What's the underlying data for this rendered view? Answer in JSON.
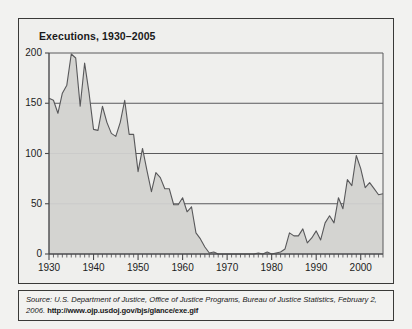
{
  "figure": {
    "title_display": "Executions, 1930–2005",
    "source_label": "Source:",
    "source_body": " U.S. Department of Justice, Office of Justice Programs, Bureau of Justice Statistics, February 2, 2006. ",
    "source_url": "http://www.ojp.usdoj.gov/bjs/glance/exe.gif",
    "panel_bg": "#efefed",
    "border_color": "#3a3a38"
  },
  "axes": {
    "y_ticks": [
      "0",
      "50",
      "100",
      "150",
      "200"
    ],
    "x_ticks": [
      "1930",
      "1940",
      "1950",
      "1960",
      "1970",
      "1980",
      "1990",
      "2000"
    ],
    "minor_tick_interval_years": 1
  },
  "chart_data": {
    "type": "area",
    "title": "Executions, 1930–2005",
    "xlabel": "",
    "ylabel": "",
    "xlim": [
      1930,
      2005
    ],
    "ylim": [
      0,
      200
    ],
    "grid": true,
    "gridlines_y": [
      50,
      100,
      150,
      200
    ],
    "legend": null,
    "line_color": "#58585a",
    "fill_color": "#d2d2d0",
    "x": [
      1930,
      1931,
      1932,
      1933,
      1934,
      1935,
      1936,
      1937,
      1938,
      1939,
      1940,
      1941,
      1942,
      1943,
      1944,
      1945,
      1946,
      1947,
      1948,
      1949,
      1950,
      1951,
      1952,
      1953,
      1954,
      1955,
      1956,
      1957,
      1958,
      1959,
      1960,
      1961,
      1962,
      1963,
      1964,
      1965,
      1966,
      1967,
      1968,
      1969,
      1970,
      1971,
      1972,
      1973,
      1974,
      1975,
      1976,
      1977,
      1978,
      1979,
      1980,
      1981,
      1982,
      1983,
      1984,
      1985,
      1986,
      1987,
      1988,
      1989,
      1990,
      1991,
      1992,
      1993,
      1994,
      1995,
      1996,
      1997,
      1998,
      1999,
      2000,
      2001,
      2002,
      2003,
      2004,
      2005
    ],
    "values": [
      155,
      153,
      140,
      160,
      168,
      199,
      195,
      147,
      190,
      160,
      124,
      123,
      147,
      131,
      120,
      117,
      131,
      153,
      119,
      119,
      82,
      105,
      83,
      62,
      81,
      76,
      65,
      65,
      49,
      49,
      56,
      42,
      47,
      21,
      15,
      7,
      1,
      2,
      0,
      0,
      0,
      0,
      0,
      0,
      0,
      0,
      0,
      1,
      0,
      2,
      0,
      1,
      2,
      5,
      21,
      18,
      18,
      25,
      11,
      16,
      23,
      14,
      31,
      38,
      31,
      56,
      45,
      74,
      68,
      98,
      85,
      66,
      71,
      65,
      59,
      60
    ],
    "series": [
      {
        "name": "Executions",
        "values": [
          155,
          153,
          140,
          160,
          168,
          199,
          195,
          147,
          190,
          160,
          124,
          123,
          147,
          131,
          120,
          117,
          131,
          153,
          119,
          119,
          82,
          105,
          83,
          62,
          81,
          76,
          65,
          65,
          49,
          49,
          56,
          42,
          47,
          21,
          15,
          7,
          1,
          2,
          0,
          0,
          0,
          0,
          0,
          0,
          0,
          0,
          0,
          1,
          0,
          2,
          0,
          1,
          2,
          5,
          21,
          18,
          18,
          25,
          11,
          16,
          23,
          14,
          31,
          38,
          31,
          56,
          45,
          74,
          68,
          98,
          85,
          66,
          71,
          65,
          59,
          60
        ]
      }
    ]
  }
}
